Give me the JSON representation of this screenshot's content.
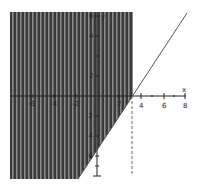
{
  "graph": {
    "type": "inequality-region",
    "colors": {
      "shade": "#3a3a3a",
      "stripe": "#8a8a8a",
      "axis": "#222222",
      "line": "#555555",
      "dashed": "#666666"
    },
    "axes": {
      "x_label": "x",
      "y_label": "y",
      "x_ticks": [
        "-6",
        "-4",
        "-2",
        "2",
        "4",
        "6",
        "8"
      ],
      "y_ticks": [
        "6",
        "4",
        "2",
        "-2",
        "-4",
        "-6"
      ]
    },
    "boundary_line": "diagonal line through (3,0)",
    "boundary_vertical": "dashed x = 3"
  }
}
